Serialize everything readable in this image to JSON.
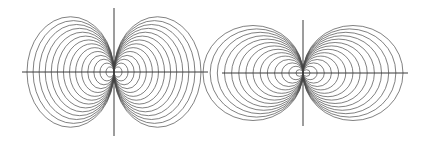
{
  "figures": [
    {
      "id": "left",
      "description": "Family of closed curves tangent to the vertical axis at the origin (taller than circles, bunching along vertical axis)",
      "origin": [
        114,
        72
      ],
      "h_axis": [
        22,
        208
      ],
      "v_axis": [
        8,
        136
      ],
      "curve_count": 14,
      "outer_half_width": 43.5,
      "inner_half_width": 4,
      "height_to_width_ratio": 1.27
    },
    {
      "id": "right",
      "description": "Family of circles tangent to the vertical axis at the origin",
      "origin": [
        303,
        73
      ],
      "h_axis": [
        222,
        408
      ],
      "v_axis": [
        20,
        126
      ],
      "curve_count": 14,
      "outer_half_width": 50,
      "inner_half_width": 3.5,
      "height_to_width_ratio": 0.95
    }
  ],
  "colors": {
    "background": "#ffffff",
    "axis": "#3a3a3a",
    "curve": "#4a4a4a"
  }
}
